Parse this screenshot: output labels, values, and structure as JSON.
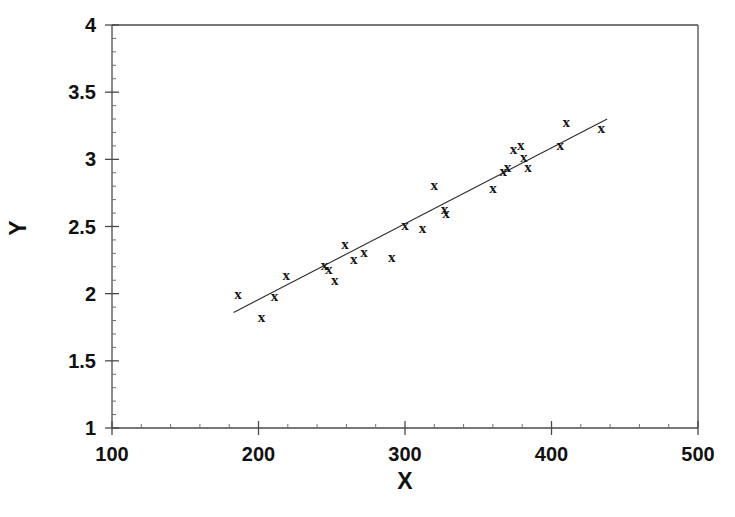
{
  "chart_data": {
    "type": "scatter",
    "title": "",
    "xlabel": "X",
    "ylabel": "Y",
    "xlim": [
      100,
      500
    ],
    "ylim": [
      1,
      4
    ],
    "xticks": [
      100,
      200,
      300,
      400,
      500
    ],
    "yticks": [
      1,
      1.5,
      2,
      2.5,
      3,
      3.5,
      4
    ],
    "xtick_labels": [
      "100",
      "200",
      "300",
      "400",
      "500"
    ],
    "ytick_labels": [
      "1",
      "1.5",
      "2",
      "2.5",
      "3",
      "3.5",
      "4"
    ],
    "x_minor_ticks": [
      120,
      140,
      160,
      180,
      220,
      240,
      260,
      280,
      320,
      340,
      360,
      380,
      420,
      440,
      460,
      480
    ],
    "y_minor_ticks": [
      1.1,
      1.2,
      1.3,
      1.4,
      1.6,
      1.7,
      1.8,
      1.9,
      2.1,
      2.2,
      2.3,
      2.4,
      2.6,
      2.7,
      2.8,
      2.9,
      3.1,
      3.2,
      3.3,
      3.4,
      3.6,
      3.7,
      3.8,
      3.9
    ],
    "grid": false,
    "legend": null,
    "marker": "x",
    "marker_glyph": "x",
    "point_color": "#141414",
    "line_color": "#2b2b2b",
    "axis_color": "#4a4a4a",
    "background_color": "#ffffff",
    "points": [
      {
        "x": 186,
        "y": 2.0
      },
      {
        "x": 202,
        "y": 1.83
      },
      {
        "x": 211,
        "y": 1.98
      },
      {
        "x": 219,
        "y": 2.14
      },
      {
        "x": 245,
        "y": 2.21
      },
      {
        "x": 248,
        "y": 2.18
      },
      {
        "x": 252,
        "y": 2.1
      },
      {
        "x": 259,
        "y": 2.37
      },
      {
        "x": 265,
        "y": 2.26
      },
      {
        "x": 272,
        "y": 2.31
      },
      {
        "x": 291,
        "y": 2.27
      },
      {
        "x": 300,
        "y": 2.51
      },
      {
        "x": 312,
        "y": 2.49
      },
      {
        "x": 320,
        "y": 2.81
      },
      {
        "x": 327,
        "y": 2.63
      },
      {
        "x": 328,
        "y": 2.6
      },
      {
        "x": 360,
        "y": 2.79
      },
      {
        "x": 367,
        "y": 2.91
      },
      {
        "x": 370,
        "y": 2.94
      },
      {
        "x": 374,
        "y": 3.08
      },
      {
        "x": 379,
        "y": 3.11
      },
      {
        "x": 381,
        "y": 3.02
      },
      {
        "x": 384,
        "y": 2.94
      },
      {
        "x": 406,
        "y": 3.11
      },
      {
        "x": 410,
        "y": 3.28
      },
      {
        "x": 434,
        "y": 3.23
      }
    ],
    "trendline": {
      "type": "linear-fit",
      "x_start": 183,
      "y_start": 1.86,
      "x_end": 438,
      "y_end": 3.3,
      "slope": 0.00565,
      "intercept": 0.826
    }
  },
  "axes": {
    "x_title": "X",
    "y_title": "Y"
  }
}
